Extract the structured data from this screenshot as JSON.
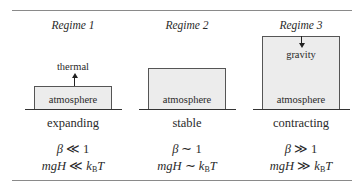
{
  "diagram": {
    "regimes": [
      {
        "title": "Regime 1",
        "box_label": "atmosphere",
        "force_label": "thermal",
        "force_direction": "up",
        "state": "expanding",
        "beta_symbol": "β",
        "beta_relation": "≪",
        "beta_value": "1",
        "energy_lhs": "mgH",
        "energy_relation": "≪",
        "energy_rhs_k": "k",
        "energy_rhs_sub": "B",
        "energy_rhs_T": "T"
      },
      {
        "title": "Regime 2",
        "box_label": "atmosphere",
        "state": "stable",
        "beta_symbol": "β",
        "beta_relation": "∼",
        "beta_value": "1",
        "energy_lhs": "mgH",
        "energy_relation": "∼",
        "energy_rhs_k": "k",
        "energy_rhs_sub": "B",
        "energy_rhs_T": "T"
      },
      {
        "title": "Regime 3",
        "box_label": "atmosphere",
        "force_label": "gravity",
        "force_direction": "down",
        "state": "contracting",
        "beta_symbol": "β",
        "beta_relation": "≫",
        "beta_value": "1",
        "energy_lhs": "mgH",
        "energy_relation": "≫",
        "energy_rhs_k": "k",
        "energy_rhs_sub": "B",
        "energy_rhs_T": "T"
      }
    ]
  }
}
